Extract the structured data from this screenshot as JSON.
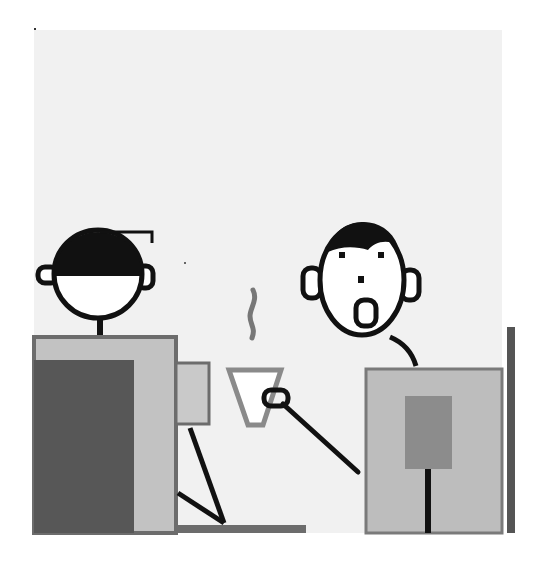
{
  "illustration": {
    "description": "Cartoon of two office workers at desks; one surprised worker with open mouth holds a steaming coffee cup",
    "colors": {
      "background": "#ffffff",
      "panel": "#f1f1f1",
      "ink": "#111111",
      "face": "#ffffff",
      "desk_light": "#bdbdbd",
      "desk_dark": "#555555",
      "outline_gray": "#7a7a7a",
      "steam": "#777777",
      "cup_outline": "#8a8a8a"
    },
    "figures": [
      {
        "name": "left-worker",
        "hair": "dark cap-like hair",
        "expression": "neutral"
      },
      {
        "name": "right-worker",
        "hair": "dark fringe",
        "expression": "surprised, open mouth"
      }
    ],
    "props": [
      "left-desk",
      "monitor",
      "chair",
      "coffee-cup",
      "steam",
      "right-desk",
      "right-panel-divider"
    ]
  }
}
